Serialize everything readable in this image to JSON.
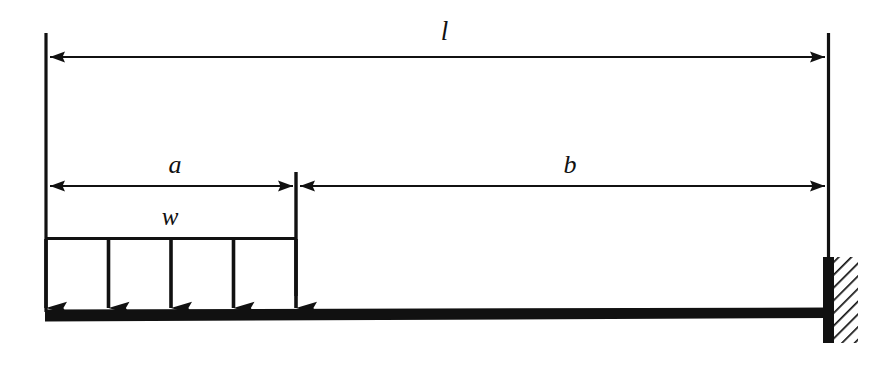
{
  "diagram": {
    "type": "cantilever-beam-free-body-diagram",
    "labels": {
      "total_length": "l",
      "loaded_length": "a",
      "unloaded_length": "b",
      "distributed_load": "w"
    },
    "dimensions": {
      "total_length_label": "l",
      "segment_a_label": "a",
      "segment_b_label": "b",
      "load_intensity_label": "w"
    },
    "colors": {
      "ink": "#111111",
      "beam": "#111111",
      "background": "#ffffff",
      "hatch": "#111111"
    },
    "geometry": {
      "left_edge_x": 46,
      "wall_face_x": 828,
      "load_end_x": 296,
      "dim_l_y": 57,
      "dim_ab_y": 186,
      "load_top_y": 238,
      "beam_top_y": 310,
      "beam_bottom_y": 321,
      "arrow_count": 5,
      "arrow_x_positions": [
        46,
        108,
        171,
        234,
        296
      ]
    },
    "elements": {
      "beam": "beam",
      "wall": "fixed-support-wall",
      "hatching": "wall-hatching",
      "load_arrows": "distributed-load-arrows",
      "load_top_line": "distributed-load-top-line",
      "dim_line_l": "dimension-line-total-length",
      "dim_line_a": "dimension-line-a",
      "dim_line_b": "dimension-line-b",
      "extension_left": "extension-line-left",
      "extension_right": "extension-line-right",
      "extension_mid": "extension-line-mid"
    }
  }
}
